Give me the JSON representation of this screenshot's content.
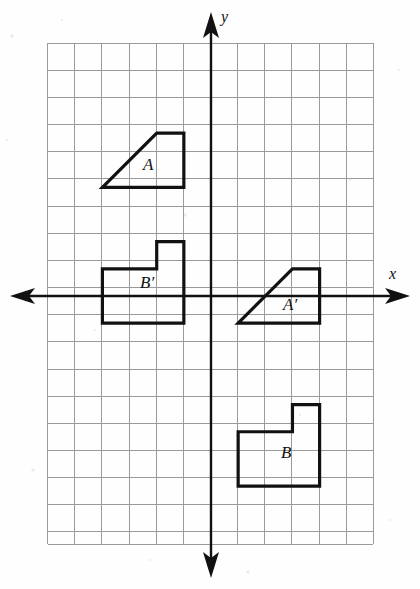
{
  "figure": {
    "background_color": "#fefefe",
    "ink_color": "#111111",
    "grid_color": "#9a9a9a"
  },
  "axes": {
    "x_axis": {
      "label": "x",
      "label_x": 389,
      "label_y": 279,
      "y_pixel": 296,
      "start_x": 10,
      "end_x": 410,
      "arrow_left": true,
      "arrow_right": true
    },
    "y_axis": {
      "label": "y",
      "label_x": 221,
      "label_y": 22,
      "x_pixel": 211,
      "start_y": 12,
      "end_y": 578,
      "arrow_up": true,
      "arrow_down": true
    }
  },
  "grid": {
    "origin_x": 211,
    "origin_y": 296,
    "cell": 27.15,
    "left": 47.6,
    "right": 373.4,
    "top": 43.2,
    "bottom": 544.2,
    "columns": 12,
    "rows": 18.45,
    "x_min_unit": -6,
    "x_max_unit": 6,
    "y_min_unit": -9.14,
    "y_max_unit": 9.31
  },
  "shapes": [
    {
      "id": "A",
      "label": "A",
      "label_x": 143,
      "label_y": 170,
      "closed": true,
      "units": [
        [
          -4,
          4
        ],
        [
          -2,
          6
        ],
        [
          -1,
          6
        ],
        [
          -1,
          4
        ]
      ],
      "description": "trapezoid in quadrant II"
    },
    {
      "id": "A-prime",
      "label": "A′",
      "label_x": 283,
      "label_y": 310,
      "closed": true,
      "units": [
        [
          1,
          -1
        ],
        [
          3,
          1
        ],
        [
          4,
          1
        ],
        [
          4,
          -1
        ]
      ],
      "description": "trapezoid straddling the x-axis in quadrants I and IV"
    },
    {
      "id": "B",
      "label": "B",
      "label_x": 281,
      "label_y": 458,
      "closed": true,
      "units": [
        [
          1,
          -5
        ],
        [
          3,
          -5
        ],
        [
          3,
          -4
        ],
        [
          4,
          -4
        ],
        [
          4,
          -7
        ],
        [
          1,
          -7
        ]
      ],
      "description": "L-shaped hexagon in quadrant IV"
    },
    {
      "id": "B-prime",
      "label": "B′",
      "label_x": 140,
      "label_y": 288,
      "closed": true,
      "units": [
        [
          -4,
          1
        ],
        [
          -2,
          1
        ],
        [
          -2,
          2
        ],
        [
          -1,
          2
        ],
        [
          -1,
          -1
        ],
        [
          -4,
          -1
        ]
      ],
      "description": "L-shaped hexagon straddling the x-axis in quadrants II and III"
    }
  ]
}
